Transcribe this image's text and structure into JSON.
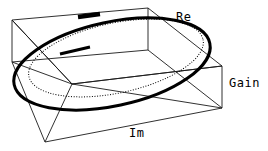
{
  "figure": {
    "title": "",
    "width": 268,
    "height": 151,
    "background": "#ffffff",
    "line_color": "#000000",
    "box_color": "#1a1a1a"
  },
  "labels": {
    "re": "Re",
    "gain": "Gain",
    "im": "Im"
  },
  "chart_data": {
    "type": "line",
    "title": "",
    "subtitle": "",
    "xlabel": "Im",
    "ylabel": "Re",
    "zlabel": "Gain",
    "projection": "3d",
    "grid": false,
    "legend": false,
    "axis_ticks": [],
    "tick_labels": [],
    "annotations": [],
    "box": {
      "description": "wireframe 3d axes box drawn in oblique projection",
      "top_face": [
        [
          12,
          20
        ],
        [
          148,
          8
        ],
        [
          222,
          66
        ],
        [
          72,
          84
        ]
      ],
      "bottom_face": [
        [
          12,
          62
        ],
        [
          148,
          50
        ],
        [
          222,
          108
        ],
        [
          45,
          142
        ]
      ],
      "verticals": [
        [
          [
            12,
            20
          ],
          [
            12,
            62
          ]
        ],
        [
          [
            222,
            66
          ],
          [
            222,
            108
          ]
        ],
        [
          [
            72,
            84
          ],
          [
            45,
            142
          ]
        ]
      ],
      "diagonals": [
        [
          [
            12,
            20
          ],
          [
            72,
            84
          ]
        ],
        [
          [
            12,
            62
          ],
          [
            72,
            84
          ]
        ],
        [
          [
            222,
            66
          ],
          [
            72,
            84
          ]
        ],
        [
          [
            222,
            108
          ],
          [
            72,
            84
          ]
        ],
        [
          [
            12,
            20
          ],
          [
            12,
            62
          ]
        ]
      ]
    },
    "series": [
      {
        "name": "response-curve",
        "style": "solid",
        "linewidth": 3,
        "color": "#000000",
        "shape": "ellipse",
        "center": [
          112,
          64
        ],
        "rx": 100,
        "ry": 42,
        "rotation_deg": -12,
        "description": "thick solid closed ellipse - gain response locus"
      },
      {
        "name": "reference-curve",
        "style": "dotted",
        "linewidth": 1,
        "color": "#000000",
        "shape": "ellipse",
        "center": [
          116,
          58
        ],
        "rx": 89,
        "ry": 35,
        "rotation_deg": -12,
        "description": "thin dotted closed ellipse - reference / projected locus"
      }
    ],
    "markers": [
      {
        "name": "marker-top",
        "on_series": "response-curve",
        "position": [
          89,
          16
        ],
        "width": 22,
        "style": "thickened-segment"
      },
      {
        "name": "marker-left",
        "on_series": "reference-curve",
        "position": [
          74,
          50
        ],
        "width": 28,
        "style": "thickened-segment"
      }
    ]
  }
}
